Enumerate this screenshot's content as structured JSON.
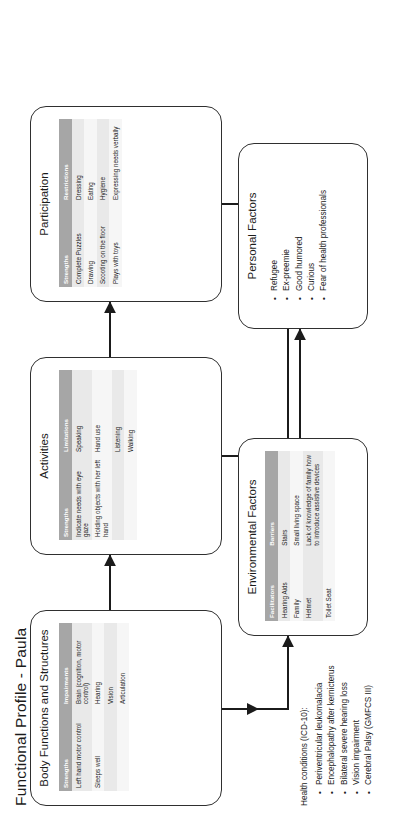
{
  "page": {
    "title": "Functional Profile - Paula"
  },
  "boxes": {
    "body_functions": {
      "title": "Body Functions and Structures",
      "columns": [
        "Strengths",
        "Impairments"
      ],
      "rows": [
        [
          "Left hand motor control",
          "Brain (cognition, motor control)"
        ],
        [
          "Sleeps well",
          "Hearing"
        ],
        [
          "",
          "Vision"
        ],
        [
          "",
          "Articulation"
        ]
      ]
    },
    "activities": {
      "title": "Activities",
      "columns": [
        "Strengths",
        "Limitations"
      ],
      "rows": [
        [
          "Indicate needs with eye gaze",
          "Speaking"
        ],
        [
          "Holding objects with her left hand",
          "Hand use"
        ],
        [
          "",
          "Listening"
        ],
        [
          "",
          "Walking"
        ]
      ]
    },
    "participation": {
      "title": "Participation",
      "columns": [
        "Strengths",
        "Restrictions"
      ],
      "rows": [
        [
          "Complete Puzzles",
          "Dressing"
        ],
        [
          "Drawing",
          "Eating"
        ],
        [
          "Scooting on the floor",
          "Hygiene"
        ],
        [
          "Plays with toys",
          "Expressing needs verbally"
        ]
      ]
    },
    "environmental_factors": {
      "title": "Environmental Factors",
      "columns": [
        "Facilitators",
        "Barriers"
      ],
      "rows": [
        [
          "Hearing Aids",
          "Stairs"
        ],
        [
          "Family",
          "Small living space"
        ],
        [
          "Helmet",
          "Lack of knowledge of family how to introduce assistive devices"
        ],
        [
          "Toilet Seat",
          ""
        ]
      ]
    },
    "personal_factors": {
      "title": "Personal Factors",
      "items": [
        "Refugee",
        "Ex-preemie",
        "Good humored",
        "Curious",
        "Fear of health professionals"
      ]
    },
    "health_conditions": {
      "title": "Health conditions (ICD-10):",
      "items": [
        "Periventricular leukomalacia",
        "Encephalopathy after kernicterus",
        "Bilateral severe hearing loss",
        "Vision impairment",
        "Cerebral Palsy (GMFCS III)"
      ]
    }
  },
  "colors": {
    "header_fill": "#a6a6a6",
    "row_odd": "#e9e9e9",
    "row_even": "#f6f6f6",
    "box_border": "#2f2f2f",
    "text": "#1b1b1b"
  }
}
